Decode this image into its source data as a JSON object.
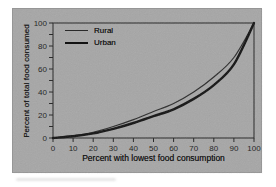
{
  "page": {
    "background": "#ffffff"
  },
  "panel": {
    "background": "#a6a6a6",
    "border_color": "#969696"
  },
  "axes": {
    "frame_color": "#232323",
    "tick_color": "#232323",
    "text_color": "#1a1a1a"
  },
  "chart_data": {
    "type": "line",
    "title": "",
    "xlabel": "Percent with lowest food consumption",
    "ylabel": "Percent of total food consumed",
    "xlim": [
      0,
      100
    ],
    "ylim": [
      0,
      100
    ],
    "grid": false,
    "legend_position": "upper-left-inside",
    "x": [
      0,
      10,
      20,
      30,
      40,
      50,
      60,
      70,
      80,
      90,
      100
    ],
    "series": [
      {
        "name": "Rural",
        "values": [
          0,
          2,
          5,
          10,
          16,
          23,
          30,
          40,
          53,
          70,
          100
        ],
        "color": "#2a2a2a",
        "width": 1.2
      },
      {
        "name": "Urban",
        "values": [
          0,
          1.5,
          4,
          8,
          13,
          19,
          25,
          34,
          46,
          64,
          100
        ],
        "color": "#121212",
        "width": 2.4
      }
    ],
    "x_ticks": [
      0,
      10,
      20,
      30,
      40,
      50,
      60,
      70,
      80,
      90,
      100
    ],
    "x_tick_labels": [
      "0",
      "10",
      "20",
      "30",
      "40",
      "50",
      "60",
      "70",
      "80",
      "90",
      "100"
    ],
    "y_ticks": [
      0,
      10,
      20,
      30,
      40,
      50,
      60,
      70,
      80,
      90,
      100
    ],
    "y_labeled_ticks": [
      0,
      20,
      40,
      60,
      80,
      100
    ],
    "y_tick_labels": [
      "0",
      "20",
      "40",
      "60",
      "80",
      "100"
    ]
  }
}
